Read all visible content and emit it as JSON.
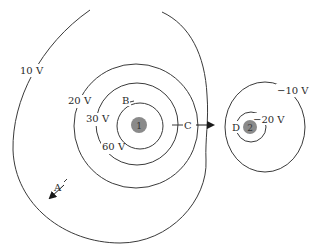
{
  "diagram": {
    "colors": {
      "line": "#3a3a3a",
      "charge_fill": "#8a8a8a",
      "text": "#2a2a2a",
      "background": "#ffffff"
    },
    "charges": [
      {
        "id": "1",
        "label": "1"
      },
      {
        "id": "2",
        "label": "2"
      }
    ],
    "equipotentials": [
      {
        "label": "10 V"
      },
      {
        "label": "20 V"
      },
      {
        "label": "30 V"
      },
      {
        "label": "60 V"
      },
      {
        "label": "−10 V"
      },
      {
        "label": "−20 V"
      }
    ],
    "points": [
      {
        "label": "A"
      },
      {
        "label": "B"
      },
      {
        "label": "C"
      },
      {
        "label": "D"
      }
    ],
    "arrows": [
      {
        "at": "A",
        "direction": "down-left"
      },
      {
        "at": "C",
        "direction": "right"
      }
    ]
  }
}
